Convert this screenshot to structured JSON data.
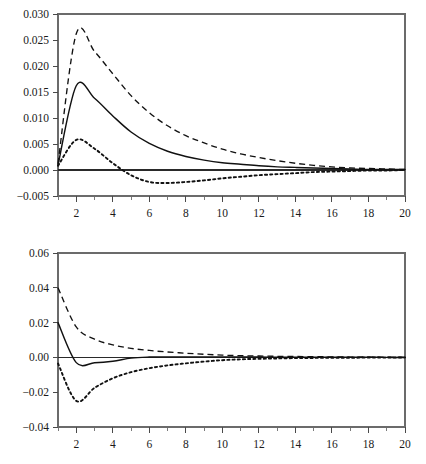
{
  "figure": {
    "background_color": "#ffffff",
    "line_color": "#111111",
    "axis_color": "#4a4a4a",
    "panel_count": 2
  },
  "chart_data": [
    {
      "id": "top-panel",
      "type": "line",
      "title": "",
      "subtitle": "",
      "xlabel": "",
      "ylabel": "",
      "grid": false,
      "legend_position": "none",
      "xlim": [
        1,
        20
      ],
      "ylim": [
        -0.005,
        0.03
      ],
      "x_ticks": [
        2,
        4,
        6,
        8,
        10,
        12,
        14,
        16,
        18,
        20
      ],
      "x_tick_labels": [
        "2",
        "4",
        "6",
        "8",
        "10",
        "12",
        "14",
        "16",
        "18",
        "20"
      ],
      "x_minor_ticks": [
        1,
        3,
        5,
        7,
        9,
        11,
        13,
        15,
        17,
        19
      ],
      "y_ticks": [
        -0.005,
        0.0,
        0.005,
        0.01,
        0.015,
        0.02,
        0.025,
        0.03
      ],
      "y_tick_labels": [
        "-0.005",
        "0.000",
        "0.005",
        "0.010",
        "0.015",
        "0.020",
        "0.025",
        "0.030"
      ],
      "zero_reference": 0.0,
      "x": [
        1,
        2,
        3,
        4,
        5,
        6,
        7,
        8,
        9,
        10,
        11,
        12,
        13,
        14,
        15,
        16,
        17,
        18,
        19,
        20
      ],
      "series": [
        {
          "name": "upper-confidence-band",
          "style": "dashed",
          "values": [
            0.0012,
            0.0262,
            0.0228,
            0.0185,
            0.0143,
            0.011,
            0.0085,
            0.0066,
            0.0052,
            0.004,
            0.0031,
            0.0024,
            0.0018,
            0.0013,
            0.0009,
            0.0006,
            0.0004,
            0.0003,
            0.0002,
            0.0001
          ]
        },
        {
          "name": "impulse-response",
          "style": "solid",
          "values": [
            0.0009,
            0.0162,
            0.0138,
            0.0104,
            0.0073,
            0.0051,
            0.0036,
            0.0026,
            0.0019,
            0.0014,
            0.0011,
            0.0008,
            0.0006,
            0.0005,
            0.0004,
            0.0003,
            0.0002,
            0.0001,
            0.0001,
            0.0001
          ]
        },
        {
          "name": "lower-confidence-band",
          "style": "dotted",
          "values": [
            0.0008,
            0.0058,
            0.0041,
            0.0013,
            -0.001,
            -0.0023,
            -0.0025,
            -0.0023,
            -0.002,
            -0.0016,
            -0.0013,
            -0.001,
            -0.0008,
            -0.0006,
            -0.0004,
            -0.0003,
            -0.0002,
            -0.0001,
            -0.0001,
            0.0
          ]
        }
      ]
    },
    {
      "id": "bottom-panel",
      "type": "line",
      "title": "",
      "subtitle": "",
      "xlabel": "",
      "ylabel": "",
      "grid": false,
      "legend_position": "none",
      "xlim": [
        1,
        20
      ],
      "ylim": [
        -0.04,
        0.06
      ],
      "x_ticks": [
        2,
        4,
        6,
        8,
        10,
        12,
        14,
        16,
        18,
        20
      ],
      "x_tick_labels": [
        "2",
        "4",
        "6",
        "8",
        "10",
        "12",
        "14",
        "16",
        "18",
        "20"
      ],
      "x_minor_ticks": [
        1,
        3,
        5,
        7,
        9,
        11,
        13,
        15,
        17,
        19
      ],
      "y_ticks": [
        -0.04,
        -0.02,
        0.0,
        0.02,
        0.04,
        0.06
      ],
      "y_tick_labels": [
        "-0.04",
        "-0.02",
        "0.00",
        "0.02",
        "0.04",
        "0.06"
      ],
      "zero_reference": 0.0,
      "x": [
        1,
        2,
        3,
        4,
        5,
        6,
        7,
        8,
        9,
        10,
        11,
        12,
        13,
        14,
        15,
        16,
        17,
        18,
        19,
        20
      ],
      "series": [
        {
          "name": "upper-confidence-band",
          "style": "dashed",
          "values": [
            0.04,
            0.0175,
            0.0105,
            0.0072,
            0.0052,
            0.004,
            0.0031,
            0.0024,
            0.0018,
            0.0013,
            0.001,
            0.0008,
            0.0006,
            0.0005,
            0.0004,
            0.0003,
            0.0002,
            0.0002,
            0.0001,
            0.0001
          ]
        },
        {
          "name": "impulse-response",
          "style": "solid",
          "values": [
            0.02,
            -0.003,
            -0.0031,
            -0.0022,
            -0.0004,
            0.0002,
            0.0003,
            0.0003,
            0.0003,
            0.0002,
            0.0002,
            0.0002,
            0.0001,
            0.0001,
            0.0001,
            0.0001,
            0.0001,
            0.0001,
            0.0,
            0.0
          ]
        },
        {
          "name": "lower-confidence-band",
          "style": "dotted",
          "values": [
            -0.0035,
            -0.025,
            -0.0175,
            -0.012,
            -0.0085,
            -0.0062,
            -0.0046,
            -0.0034,
            -0.0024,
            -0.0016,
            -0.0011,
            -0.0008,
            -0.0006,
            -0.0004,
            -0.0003,
            -0.0002,
            -0.0002,
            -0.0001,
            -0.0001,
            0.0
          ]
        }
      ]
    }
  ]
}
